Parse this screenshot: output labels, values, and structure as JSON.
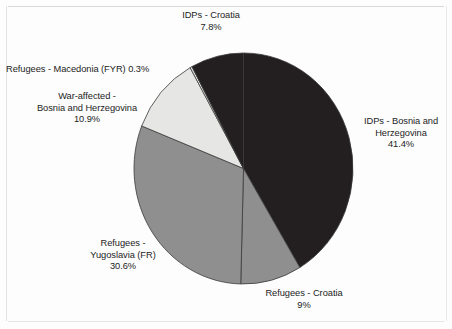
{
  "chart_data": {
    "type": "pie",
    "title": "",
    "subtitle": "",
    "xlabel": "",
    "ylabel": "",
    "legend_position": "none",
    "grid": false,
    "start_angle_deg": 0,
    "direction": "clockwise",
    "categories": [
      "IDPs - Bosnia and Herzegovina",
      "Refugees - Croatia",
      "Refugees - Yugoslavia (FR)",
      "War-affected - Bosnia and Herzegovina",
      "Refugees - Macedonia (FYR)",
      "IDPs - Croatia"
    ],
    "values": [
      41.4,
      9,
      30.6,
      10.9,
      0.3,
      7.8
    ],
    "value_labels": [
      "41.4%",
      "9%",
      "30.6%",
      "10.9%",
      "0.3%",
      "7.8%"
    ],
    "slices": [
      {
        "name": "IDPs - Bosnia and Herzegovina",
        "value": 41.4,
        "value_label": "41.4%",
        "color": "#231f20",
        "start_deg": 0.0,
        "end_deg": 149.04
      },
      {
        "name": "Refugees - Croatia",
        "value": 9.0,
        "value_label": "9%",
        "color": "#8f8f8f",
        "start_deg": 149.04,
        "end_deg": 181.44
      },
      {
        "name": "Refugees - Yugoslavia (FR)",
        "value": 30.6,
        "value_label": "30.6%",
        "color": "#8f8f8f",
        "start_deg": 181.44,
        "end_deg": 291.6
      },
      {
        "name": "War-affected - Bosnia and Herzegovina",
        "value": 10.9,
        "value_label": "10.9%",
        "color": "#e6e6e4",
        "start_deg": 291.6,
        "end_deg": 330.84
      },
      {
        "name": "Refugees - Macedonia (FYR)",
        "value": 0.3,
        "value_label": "0.3%",
        "color": "#e6e6e4",
        "start_deg": 330.84,
        "end_deg": 331.92
      },
      {
        "name": "IDPs - Croatia",
        "value": 7.8,
        "value_label": "7.8%",
        "color": "#231f20",
        "start_deg": 331.92,
        "end_deg": 360.0
      }
    ]
  },
  "labels": {
    "idps_croatia": "IDPs - Croatia\n7.8%",
    "refugees_macedonia": "Refugees - Macedonia (FYR)  0.3%",
    "war_affected": "War-affected -\nBosnia and Herzegovina\n10.9%",
    "idps_bosnia": "IDPs - Bosnia and\nHerzegovina\n41.4%",
    "refugees_yugoslavia": "Refugees -\nYugoslavia (FR)\n30.6%",
    "refugees_croatia": "Refugees - Croatia\n9%"
  },
  "colors": {
    "dark_slice": "#231f20",
    "medium_slice": "#8f8f8f",
    "light_slice": "#e6e6e4",
    "slice_outline": "#3a3a3a",
    "background": "#fdfdfd",
    "text": "#1c1c1c"
  }
}
